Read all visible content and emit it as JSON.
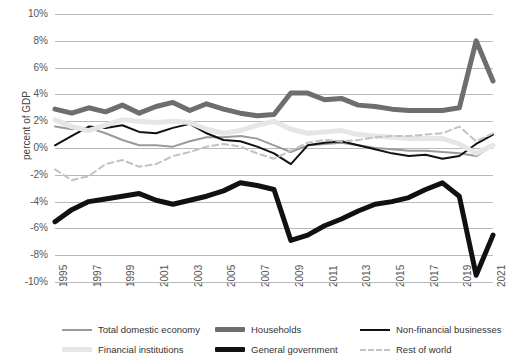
{
  "axes": {
    "ylabel": "percent of GDP",
    "yticks": [
      "10%",
      "8%",
      "6%",
      "4%",
      "2%",
      "0%",
      "-2%",
      "-4%",
      "-6%",
      "-8%",
      "-10%"
    ],
    "xticks": [
      "1995",
      "1997",
      "1999",
      "2001",
      "2003",
      "2005",
      "2007",
      "2009",
      "2011",
      "2013",
      "2015",
      "2017",
      "2019",
      "2021"
    ]
  },
  "legend": [
    {
      "label": "Total domestic economy",
      "style": "thin",
      "color": "#9a9a9a"
    },
    {
      "label": "Households",
      "style": "thick",
      "color": "#6e6e6e"
    },
    {
      "label": "Non-financial businesses",
      "style": "thin",
      "color": "#111111"
    },
    {
      "label": "Financial institutions",
      "style": "thick",
      "color": "#e6e6e6"
    },
    {
      "label": "General government",
      "style": "thick",
      "color": "#111111"
    },
    {
      "label": "Rest of world",
      "style": "dash",
      "color": "#c2c2c2"
    }
  ],
  "chart_data": {
    "type": "line",
    "title": "",
    "xlabel": "",
    "ylabel": "percent of GDP",
    "xlim": [
      1995,
      2021
    ],
    "ylim": [
      -10,
      10
    ],
    "grid": true,
    "legend_position": "bottom",
    "x": [
      1995,
      1996,
      1997,
      1998,
      1999,
      2000,
      2001,
      2002,
      2003,
      2004,
      2005,
      2006,
      2007,
      2008,
      2009,
      2010,
      2011,
      2012,
      2013,
      2014,
      2015,
      2016,
      2017,
      2018,
      2019,
      2020,
      2021
    ],
    "series": [
      {
        "name": "Total domestic economy",
        "color": "#9a9a9a",
        "width": 2,
        "dash": "none",
        "values": [
          1.6,
          1.4,
          1.5,
          1.1,
          0.6,
          0.2,
          0.2,
          0.1,
          0.5,
          0.8,
          0.8,
          0.9,
          0.7,
          0.2,
          -0.3,
          0.2,
          0.3,
          0.4,
          0.2,
          0.0,
          -0.1,
          -0.2,
          -0.2,
          -0.3,
          -0.4,
          -0.6,
          0.2
        ]
      },
      {
        "name": "Households",
        "color": "#6e6e6e",
        "width": 5,
        "dash": "none",
        "values": [
          2.9,
          2.6,
          3.0,
          2.7,
          3.2,
          2.6,
          3.1,
          3.4,
          2.8,
          3.3,
          2.9,
          2.6,
          2.4,
          2.5,
          4.1,
          4.1,
          3.6,
          3.7,
          3.2,
          3.1,
          2.9,
          2.8,
          2.8,
          2.8,
          3.0,
          8.0,
          5.0
        ]
      },
      {
        "name": "Non-financial businesses",
        "color": "#111111",
        "width": 2,
        "dash": "none",
        "values": [
          0.2,
          0.9,
          1.6,
          1.5,
          1.7,
          1.2,
          1.1,
          1.5,
          1.8,
          1.1,
          0.6,
          0.5,
          0.1,
          -0.4,
          -1.2,
          0.2,
          0.4,
          0.5,
          0.2,
          -0.1,
          -0.4,
          -0.6,
          -0.5,
          -0.8,
          -0.6,
          0.3,
          1.0
        ]
      },
      {
        "name": "Financial institutions",
        "color": "#e6e6e6",
        "width": 5,
        "dash": "none",
        "values": [
          2.1,
          1.6,
          1.3,
          1.7,
          2.1,
          2.0,
          1.9,
          2.0,
          1.9,
          1.4,
          1.1,
          1.3,
          1.7,
          2.0,
          1.4,
          1.1,
          1.2,
          1.3,
          1.0,
          0.9,
          0.8,
          0.7,
          0.7,
          0.7,
          0.3,
          -0.4,
          0.2
        ]
      },
      {
        "name": "General government",
        "color": "#111111",
        "width": 5,
        "dash": "none",
        "values": [
          -5.5,
          -4.6,
          -4.0,
          -3.8,
          -3.6,
          -3.4,
          -3.9,
          -4.2,
          -3.9,
          -3.6,
          -3.2,
          -2.6,
          -2.8,
          -3.1,
          -6.9,
          -6.5,
          -5.8,
          -5.3,
          -4.7,
          -4.2,
          -4.0,
          -3.7,
          -3.1,
          -2.6,
          -3.6,
          -9.5,
          -6.5
        ]
      },
      {
        "name": "Rest of world",
        "color": "#c2c2c2",
        "width": 2,
        "dash": "6 4",
        "values": [
          -1.6,
          -2.4,
          -2.1,
          -1.2,
          -0.9,
          -1.4,
          -1.2,
          -0.6,
          -0.3,
          0.1,
          0.3,
          0.1,
          -0.4,
          -0.8,
          -0.2,
          0.4,
          0.6,
          0.5,
          0.6,
          0.8,
          0.9,
          0.9,
          1.0,
          1.1,
          1.6,
          0.5,
          1.1
        ]
      }
    ]
  }
}
